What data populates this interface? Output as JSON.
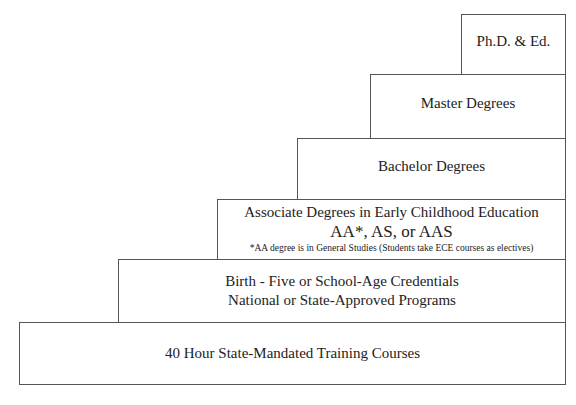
{
  "diagram": {
    "type": "staircase",
    "steps": [
      {
        "level": 1,
        "lines": [
          "40 Hour State-Mandated Training Courses"
        ]
      },
      {
        "level": 2,
        "lines": [
          "Birth - Five or School-Age Credentials",
          "National or State-Approved Programs"
        ]
      },
      {
        "level": 3,
        "lines": [
          "Associate Degrees in Early Childhood Education",
          "AA*, AS, or AAS"
        ],
        "note": "*AA degree is in General Studies (Students take ECE courses as electives)"
      },
      {
        "level": 4,
        "lines": [
          "Bachelor Degrees"
        ]
      },
      {
        "level": 5,
        "lines": [
          "Master Degrees"
        ]
      },
      {
        "level": 6,
        "lines": [
          "Ph.D. & Ed."
        ]
      }
    ],
    "colors": {
      "border": "#555555",
      "text": "#222222",
      "background": "#ffffff"
    }
  }
}
